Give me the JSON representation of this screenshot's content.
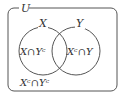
{
  "diagram": {
    "type": "venn",
    "universe_label": "U",
    "sets": [
      {
        "label": "X"
      },
      {
        "label": "Y"
      }
    ],
    "regions": {
      "x_only": "X∩Yᶜ",
      "y_only": "Xᶜ∩Y",
      "neither": "Xᶜ∩Yᶜ"
    },
    "colors": {
      "stroke": "#555555",
      "text": "#333333",
      "background": "#ffffff"
    }
  }
}
